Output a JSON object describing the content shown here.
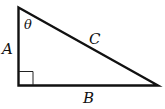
{
  "diagram": {
    "type": "right-triangle",
    "labels": {
      "side_vertical": "A",
      "side_horizontal": "B",
      "hypotenuse": "C",
      "angle": "θ"
    },
    "right_angle_marker": true,
    "colors": {
      "stroke": "#111111",
      "background": "#ffffff"
    }
  }
}
